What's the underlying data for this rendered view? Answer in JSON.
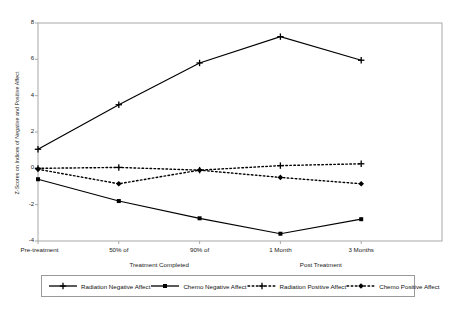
{
  "chart_data": {
    "type": "line",
    "title": "",
    "xlabel": "",
    "ylabel": "Z-Scores on Indices of Negative and Positive Affect",
    "categories": [
      "Pre-treatment",
      "50% of",
      "90% of",
      "1 Month",
      "3 Months"
    ],
    "group_labels": [
      {
        "text": "Treatment Completed",
        "spans": [
          "50% of",
          "90% of"
        ]
      },
      {
        "text": "Post Treatment",
        "spans": [
          "1 Month",
          "3 Months"
        ]
      }
    ],
    "ylim": [
      -4,
      8
    ],
    "yticks": [
      8,
      6,
      4,
      2,
      0,
      -2,
      -4
    ],
    "ytick_labels": [
      "8",
      "6",
      "4",
      "2",
      "0",
      "-2",
      "-4"
    ],
    "grid": false,
    "legend_position": "bottom",
    "series": [
      {
        "name": "Radiation Negative Affect",
        "values": [
          1.05,
          3.5,
          5.8,
          7.25,
          5.95
        ],
        "style": "solid",
        "marker": "cross",
        "color": "#000000"
      },
      {
        "name": "Chemo Negative Affect",
        "values": [
          -0.6,
          -1.8,
          -2.75,
          -3.6,
          -2.8
        ],
        "style": "solid",
        "marker": "square",
        "color": "#000000"
      },
      {
        "name": "Radiation Positive Affect",
        "values": [
          0.0,
          0.05,
          -0.1,
          0.15,
          0.25
        ],
        "style": "dashed",
        "marker": "cross",
        "color": "#000000"
      },
      {
        "name": "Chemo Positive Affect",
        "values": [
          -0.05,
          -0.85,
          -0.1,
          -0.5,
          -0.85
        ],
        "style": "dashed",
        "marker": "diamond",
        "color": "#000000"
      }
    ]
  }
}
